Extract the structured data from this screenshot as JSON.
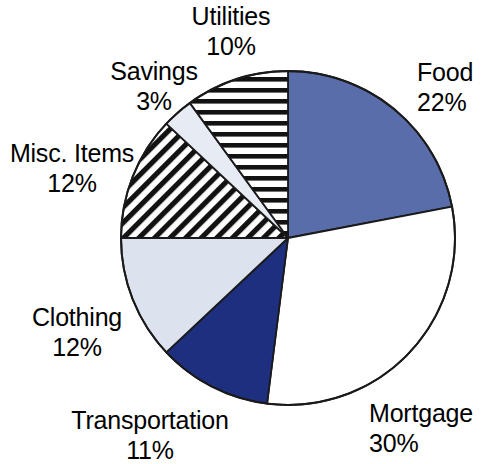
{
  "chart_data": {
    "type": "pie",
    "title": "",
    "subtitle": "",
    "xlabel": "",
    "ylabel": "",
    "legend_position": "none",
    "grid": false,
    "value_unit": "%",
    "total": 100,
    "start_angle_deg": 0,
    "direction": "clockwise",
    "categories": [
      "Food",
      "Mortgage",
      "Transportation",
      "Clothing",
      "Misc. Items",
      "Savings",
      "Utilities"
    ],
    "values": [
      22,
      30,
      11,
      12,
      12,
      3,
      10
    ],
    "slices": [
      {
        "label": "Food",
        "value": 22,
        "value_text": "22%",
        "fill_style": "solid",
        "color": "#5a6dab",
        "stroke": "#1a1a1a"
      },
      {
        "label": "Mortgage",
        "value": 30,
        "value_text": "30%",
        "fill_style": "solid",
        "color": "#ffffff",
        "stroke": "#1a1a1a"
      },
      {
        "label": "Transportation",
        "value": 11,
        "value_text": "11%",
        "fill_style": "solid",
        "color": "#1d2f7e",
        "stroke": "#1a1a1a"
      },
      {
        "label": "Clothing",
        "value": 12,
        "value_text": "12%",
        "fill_style": "solid",
        "color": "#dde3ee",
        "stroke": "#1a1a1a"
      },
      {
        "label": "Misc. Items",
        "value": 12,
        "value_text": "12%",
        "fill_style": "diagonal-hatch",
        "color": "#ffffff",
        "stroke": "#1a1a1a"
      },
      {
        "label": "Savings",
        "value": 3,
        "value_text": "3%",
        "fill_style": "solid",
        "color": "#e7ecf4",
        "stroke": "#1a1a1a"
      },
      {
        "label": "Utilities",
        "value": 10,
        "value_text": "10%",
        "fill_style": "horizontal-hatch",
        "color": "#ffffff",
        "stroke": "#1a1a1a"
      }
    ]
  },
  "labels": {
    "food": {
      "category": "Food",
      "percent": "22%"
    },
    "mortgage": {
      "category": "Mortgage",
      "percent": "30%"
    },
    "transportation": {
      "category": "Transportation",
      "percent": "11%"
    },
    "clothing": {
      "category": "Clothing",
      "percent": "12%"
    },
    "misc_items": {
      "category": "Misc. Items",
      "percent": "12%"
    },
    "savings": {
      "category": "Savings",
      "percent": "3%"
    },
    "utilities": {
      "category": "Utilities",
      "percent": "10%"
    }
  },
  "geometry": {
    "center_x": 288,
    "center_y": 238,
    "radius": 167
  }
}
